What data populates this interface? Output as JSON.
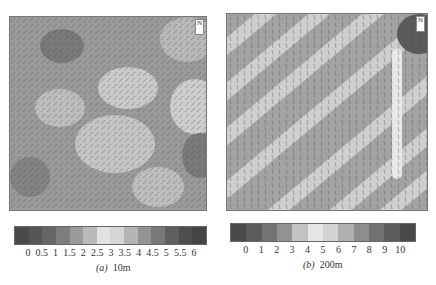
{
  "figure": {
    "panels": [
      {
        "id": "a",
        "label": "(a)",
        "caption": "10m",
        "marker": "N",
        "colorbar": {
          "ticks": [
            "0",
            "0.5",
            "1",
            "1.5",
            "2",
            "2.5",
            "3",
            "3.5",
            "4",
            "4.5",
            "5",
            "5.5",
            "6"
          ],
          "colors": [
            "#4a4a4a",
            "#565656",
            "#666666",
            "#7d7d7d",
            "#9a9a9a",
            "#bababa",
            "#e2e2e2",
            "#d6d6d6",
            "#b4b4b4",
            "#939393",
            "#787878",
            "#5f5f5f",
            "#4e4e4e",
            "#454545"
          ]
        }
      },
      {
        "id": "b",
        "label": "(b)",
        "caption": "200m",
        "marker": "N",
        "colorbar": {
          "ticks": [
            "0",
            "1",
            "2",
            "3",
            "4",
            "5",
            "6",
            "7",
            "8",
            "9",
            "10"
          ],
          "colors": [
            "#4a4a4a",
            "#5c5c5c",
            "#737373",
            "#929292",
            "#c2c2c2",
            "#e6e6e6",
            "#d4d4d4",
            "#b0b0b0",
            "#8e8e8e",
            "#717171",
            "#5d5d5d",
            "#494949"
          ]
        }
      }
    ]
  }
}
